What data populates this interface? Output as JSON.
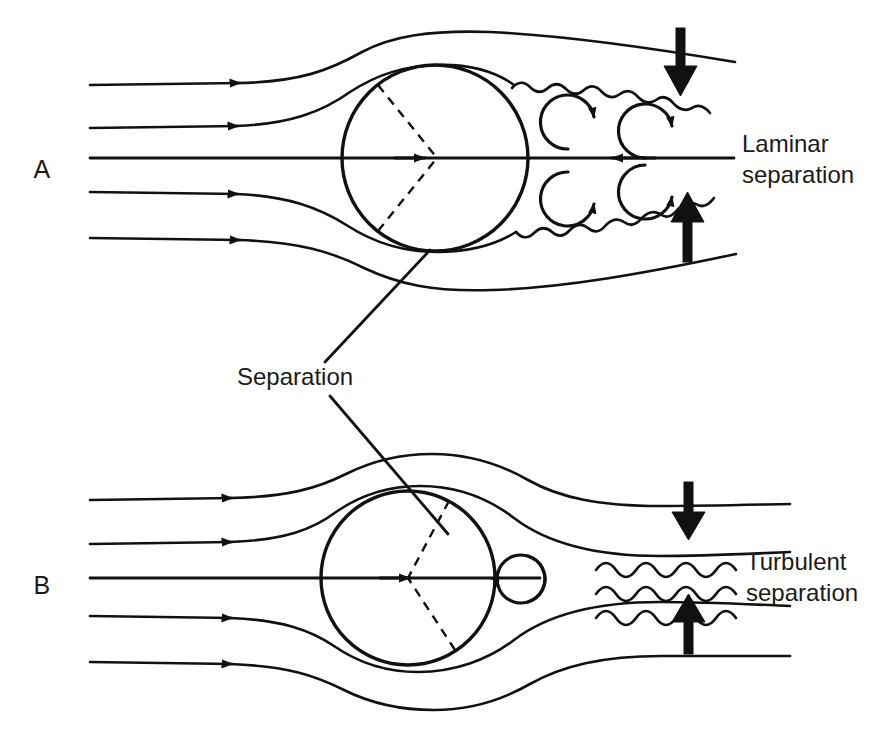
{
  "figure": {
    "background_color": "#ffffff",
    "ink_color": "#111111",
    "width": 881,
    "height": 743
  },
  "panels": [
    {
      "id": "A",
      "letter": "A",
      "letter_x": 42,
      "letter_y": 178,
      "regime": "laminar",
      "sphere": {
        "cx": 435,
        "cy": 158,
        "r": 93
      },
      "separation_angles_deg": [
        128,
        -128
      ],
      "inflow_streamline_count": 5,
      "eddy_count": 4,
      "wavy_shear_layers": 2,
      "pressure_arrows": 2
    },
    {
      "id": "B",
      "letter": "B",
      "letter_x": 42,
      "letter_y": 594,
      "regime": "turbulent",
      "sphere": {
        "cx": 408,
        "cy": 578,
        "r": 87
      },
      "separation_angles_deg": [
        62,
        -57
      ],
      "inflow_streamline_count": 5,
      "eddy_count": 2,
      "wavy_shear_layers": 3,
      "pressure_arrows": 2
    }
  ],
  "annotations": {
    "laminar_separation": {
      "line1": "Laminar",
      "line2": "separation",
      "x": 742,
      "y1": 152,
      "y2": 183
    },
    "turbulent_separation": {
      "line1": "Turbulent",
      "line2": "separation",
      "x": 746,
      "y1": 570,
      "y2": 601
    },
    "separation": {
      "text": "Separation",
      "x": 237,
      "y": 385
    }
  },
  "icons": {
    "flow_arrowhead": "right-arrowhead-icon",
    "eddy_curl": "vortex-curl-icon",
    "pressure_arrow_down": "thick-down-arrow-icon",
    "pressure_arrow_up": "thick-up-arrow-icon",
    "wavy_shear": "wavy-line-icon",
    "dashed_separation": "dashed-separation-line-icon"
  }
}
